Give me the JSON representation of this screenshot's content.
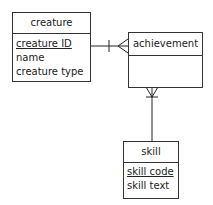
{
  "diagram": {
    "type": "entity-relationship",
    "entities": [
      {
        "name": "creature",
        "attributes": [
          {
            "label": "creature ID",
            "key": true
          },
          {
            "label": "name",
            "key": false
          },
          {
            "label": "creature type",
            "key": false
          }
        ]
      },
      {
        "name": "achievement",
        "attributes": []
      },
      {
        "name": "skill",
        "attributes": [
          {
            "label": "skill code",
            "key": true
          },
          {
            "label": "skill text",
            "key": false
          }
        ]
      }
    ],
    "relationships": [
      {
        "from": "creature",
        "to": "achievement",
        "from_cardinality": "one",
        "to_cardinality": "many"
      },
      {
        "from": "skill",
        "to": "achievement",
        "from_cardinality": "one",
        "to_cardinality": "many"
      }
    ]
  }
}
